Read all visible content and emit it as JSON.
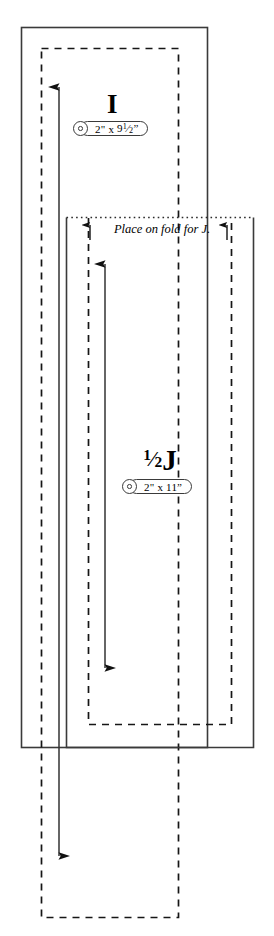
{
  "diagram": {
    "background_color": "#ffffff",
    "line_color": "#3a3a3a",
    "dash_color": "#1a1a1a",
    "width": 274,
    "height": 936
  },
  "pieces": [
    {
      "id": "I",
      "letter": "I",
      "letter_plain": "I",
      "dimension_label": "2\" x 9½\"",
      "dimension_width": "2\"",
      "dimension_separator": "x",
      "dimension_height_whole": "9",
      "dimension_height_fraction": "1/2",
      "cut_line_style": "solid",
      "seam_line_style": "dashed"
    },
    {
      "id": "J",
      "letter": "½J",
      "letter_plain": "1/2J",
      "letter_fraction_numerator": "1",
      "letter_fraction_denominator": "2",
      "letter_base": "J",
      "dimension_label": "2\" x 11\"",
      "dimension_width": "2\"",
      "dimension_separator": "x",
      "dimension_height_whole": "11",
      "cut_line_style": "solid",
      "seam_line_style": "dashed",
      "fold_line_style": "dotted"
    }
  ],
  "annotations": {
    "fold_note": "Place on fold for J.",
    "grain_arrows": [
      {
        "name": "grain-arrow-i",
        "direction": "double-vertical"
      },
      {
        "name": "grain-arrow-j",
        "direction": "double-vertical"
      }
    ],
    "fold_markers": [
      {
        "name": "fold-marker-left",
        "direction": "up"
      },
      {
        "name": "fold-marker-right",
        "direction": "up"
      }
    ]
  },
  "legend": {
    "solid_means": "cut line",
    "dashed_means": "stitching line",
    "dotted_means": "fold line"
  }
}
